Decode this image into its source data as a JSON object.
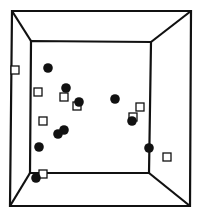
{
  "figure": {
    "type": "3d-box-scatter",
    "stroke_color": "#111111",
    "background": "#ffffff",
    "outer_box": {
      "tl": [
        12,
        11
      ],
      "tr": [
        191,
        11
      ],
      "br": [
        190,
        206
      ],
      "bl": [
        10,
        206
      ]
    },
    "inner_box": {
      "tl": [
        31,
        41
      ],
      "tr": [
        151,
        42
      ],
      "br": [
        149,
        173
      ],
      "bl": [
        30,
        173
      ]
    }
  },
  "chart_data": {
    "type": "scatter",
    "title": "",
    "xlabel": "",
    "ylabel": "",
    "grid": false,
    "legend": null,
    "series": [
      {
        "name": "filled-circles",
        "marker": "circle-filled",
        "color": "#111111",
        "points": [
          [
            48,
            68
          ],
          [
            66,
            88
          ],
          [
            79,
            102
          ],
          [
            115,
            99
          ],
          [
            132,
            121
          ],
          [
            64,
            130
          ],
          [
            58,
            134
          ],
          [
            39,
            147
          ],
          [
            149,
            148
          ],
          [
            36,
            178
          ]
        ]
      },
      {
        "name": "open-squares",
        "marker": "square-open",
        "color": "#111111",
        "points": [
          [
            15,
            70
          ],
          [
            38,
            92
          ],
          [
            64,
            97
          ],
          [
            77,
            106
          ],
          [
            140,
            107
          ],
          [
            133,
            117
          ],
          [
            43,
            121
          ],
          [
            167,
            157
          ],
          [
            43,
            174
          ]
        ]
      }
    ]
  }
}
